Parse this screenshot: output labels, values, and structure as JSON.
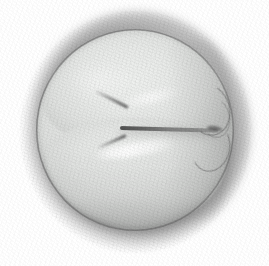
{
  "figure": {
    "kind": "pencil-illustration",
    "medium": "graphite pencil drawing",
    "caption": "",
    "background_color": "#ffffff",
    "canvas": {
      "width_px": 269,
      "height_px": 266
    },
    "palette": {
      "background": "#ffffff",
      "halo_gray": "#adadad",
      "cell_light": "#eceeec",
      "cell_mid": "#e0e2e0",
      "cell_shadow": "#c2c4c2",
      "furrow_dark": "#3c3c3c",
      "rim_line": "#696969",
      "highlight": "#ffffff"
    },
    "parts": [
      {
        "id": "zona-pellucida",
        "label": "zona pellucida",
        "description": "soft gray halo ring surrounding the cell",
        "bounds": {
          "x": 20,
          "y": 11,
          "width": 231,
          "height": 242
        }
      },
      {
        "id": "cell-body",
        "label": "cell body",
        "description": "rounded light gray sphere with dark rim arc",
        "bounds": {
          "x": 37,
          "y": 30,
          "width": 196,
          "height": 200
        }
      },
      {
        "id": "blastomere-upper",
        "label": "upper blastomere",
        "description": "upper of two daughter cells",
        "bounds": {
          "x": 44,
          "y": 36,
          "width": 183,
          "height": 112
        }
      },
      {
        "id": "blastomere-lower",
        "label": "lower blastomere",
        "description": "lower of two daughter cells",
        "bounds": {
          "x": 47,
          "y": 118,
          "width": 180,
          "height": 108
        }
      },
      {
        "id": "cleavage-furrow",
        "label": "cleavage furrow",
        "description": "dark horizontal cleft dividing the two blastomeres",
        "apex": {
          "x": 122,
          "y": 125
        },
        "extends_to": {
          "x": 218,
          "y": 130
        }
      },
      {
        "id": "furrow-junction-right",
        "label": "membrane junction",
        "description": "Y-shaped junction where the furrow meets the membrane at the right edge",
        "bounds": {
          "x": 190,
          "y": 92,
          "width": 42,
          "height": 76
        }
      },
      {
        "id": "highlight-lower",
        "label": "specular highlight",
        "description": "bright diagonal streak across the lower blastomere",
        "bounds": {
          "x": 92,
          "y": 143,
          "width": 86,
          "height": 13
        }
      },
      {
        "id": "highlight-upper",
        "label": "specular highlight",
        "description": "softer diagonal sheen on the upper blastomere",
        "bounds": {
          "x": 120,
          "y": 92,
          "width": 62,
          "height": 11
        }
      }
    ]
  }
}
